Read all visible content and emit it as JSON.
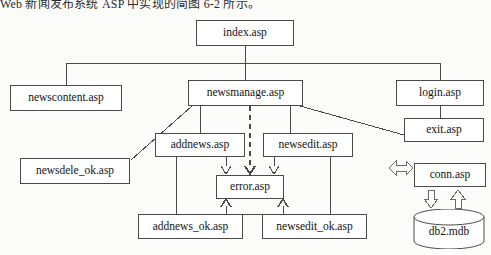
{
  "document": {
    "heading": "Web 新闻发布系统 ASP 中实现的简图 6-2 所示。",
    "type": "system-structure-flowchart"
  },
  "diagram": {
    "nodes": [
      {
        "id": "index",
        "label": "index.asp",
        "x": 196,
        "y": 20,
        "w": 98,
        "h": 26,
        "shape": "rect"
      },
      {
        "id": "newscontent",
        "label": "newscontent.asp",
        "x": 10,
        "y": 85,
        "w": 112,
        "h": 26,
        "shape": "rect"
      },
      {
        "id": "newsmanage",
        "label": "newsmanage.asp",
        "x": 188,
        "y": 80,
        "w": 115,
        "h": 26,
        "shape": "rect"
      },
      {
        "id": "login",
        "label": "login.asp",
        "x": 396,
        "y": 80,
        "w": 88,
        "h": 26,
        "shape": "rect"
      },
      {
        "id": "exit",
        "label": "exit.asp",
        "x": 404,
        "y": 118,
        "w": 80,
        "h": 24,
        "shape": "rect"
      },
      {
        "id": "addnews",
        "label": "addnews.asp",
        "x": 155,
        "y": 133,
        "w": 90,
        "h": 24,
        "shape": "rect"
      },
      {
        "id": "newsedit",
        "label": "newsedit.asp",
        "x": 263,
        "y": 133,
        "w": 90,
        "h": 24,
        "shape": "rect"
      },
      {
        "id": "newsdele_ok",
        "label": "newsdele_ok.asp",
        "x": 20,
        "y": 158,
        "w": 110,
        "h": 26,
        "shape": "rect"
      },
      {
        "id": "error",
        "label": "error.asp",
        "x": 216,
        "y": 175,
        "w": 68,
        "h": 24,
        "shape": "rect"
      },
      {
        "id": "addnews_ok",
        "label": "addnews_ok.asp",
        "x": 138,
        "y": 214,
        "w": 105,
        "h": 25,
        "shape": "rect"
      },
      {
        "id": "newsedit_ok",
        "label": "newsedit_ok.asp",
        "x": 262,
        "y": 214,
        "w": 105,
        "h": 25,
        "shape": "rect"
      },
      {
        "id": "conn",
        "label": "conn.asp",
        "x": 414,
        "y": 163,
        "w": 72,
        "h": 24,
        "shape": "rect"
      },
      {
        "id": "db2",
        "label": "db2.mdb",
        "x": 412,
        "y": 209,
        "w": 74,
        "h": 40,
        "shape": "cylinder"
      }
    ],
    "edges": [
      {
        "from": "index",
        "to": "bus",
        "style": "solid"
      },
      {
        "from": "bus",
        "to": "newscontent",
        "style": "solid"
      },
      {
        "from": "bus",
        "to": "newsmanage",
        "style": "solid"
      },
      {
        "from": "bus",
        "to": "login",
        "style": "solid"
      },
      {
        "from": "login",
        "to": "exit",
        "style": "solid"
      },
      {
        "from": "newsmanage",
        "to": "addnews",
        "style": "solid"
      },
      {
        "from": "newsmanage",
        "to": "newsedit",
        "style": "solid"
      },
      {
        "from": "newsmanage",
        "to": "error",
        "style": "dashed",
        "arrow": "open-v"
      },
      {
        "from": "newsmanage",
        "to": "newsdele_ok",
        "style": "solid"
      },
      {
        "from": "newsmanage",
        "to": "exit",
        "style": "solid"
      },
      {
        "from": "addnews",
        "to": "error",
        "style": "solid",
        "arrow": "open-v"
      },
      {
        "from": "newsedit",
        "to": "error",
        "style": "solid",
        "arrow": "open-v"
      },
      {
        "from": "addnews",
        "to": "addnews_ok",
        "style": "solid"
      },
      {
        "from": "newsedit",
        "to": "newsedit_ok",
        "style": "solid"
      },
      {
        "from": "addnews_ok",
        "to": "error",
        "style": "solid",
        "arrow": "open-caret-up"
      },
      {
        "from": "newsedit_ok",
        "to": "error",
        "style": "solid",
        "arrow": "open-caret-up"
      },
      {
        "from": "external",
        "to": "conn",
        "style": "block-arrow",
        "direction": "double-horizontal"
      },
      {
        "from": "conn",
        "to": "db2",
        "style": "block-arrow",
        "direction": "down"
      },
      {
        "from": "db2",
        "to": "conn",
        "style": "block-arrow",
        "direction": "up"
      }
    ],
    "colors": {
      "stroke": "#4a4a4a",
      "fill": "#ffffff",
      "text": "#121212",
      "page": "#fcfcfb"
    }
  }
}
